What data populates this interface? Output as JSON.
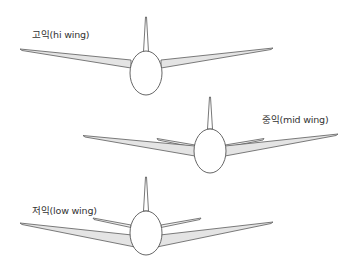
{
  "diagram": {
    "panels": [
      {
        "id": "hi",
        "label": "고익(hi wing)",
        "wing_position": "high"
      },
      {
        "id": "mid",
        "label": "중익(mid wing)",
        "wing_position": "middle"
      },
      {
        "id": "low",
        "label": "저익(low wing)",
        "wing_position": "low"
      }
    ],
    "colors": {
      "background": "#ffffff",
      "outline": "#555555",
      "wing_fill": "#e4e4e4",
      "text": "#333333"
    }
  }
}
